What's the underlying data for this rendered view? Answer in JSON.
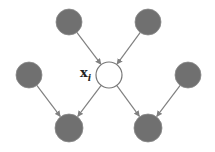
{
  "diagram": {
    "colors": {
      "observed_fill": "#707070",
      "observed_stroke": "#8a8a8a",
      "target_fill": "#ffffff",
      "target_stroke": "#777777",
      "edge": "#808080"
    },
    "target": {
      "label_main": "x",
      "label_sub": "i"
    },
    "nodes": [
      {
        "id": "parent-1",
        "role": "parent",
        "cx": 69,
        "cy": 22,
        "r": 13
      },
      {
        "id": "parent-2",
        "role": "parent",
        "cx": 148,
        "cy": 22,
        "r": 13
      },
      {
        "id": "coparent-1",
        "role": "co-parent",
        "cx": 29,
        "cy": 75,
        "r": 13
      },
      {
        "id": "target",
        "role": "target",
        "cx": 109,
        "cy": 75,
        "r": 13
      },
      {
        "id": "coparent-2",
        "role": "co-parent",
        "cx": 188,
        "cy": 75,
        "r": 13
      },
      {
        "id": "child-1",
        "role": "child",
        "cx": 69,
        "cy": 128,
        "r": 14
      },
      {
        "id": "child-2",
        "role": "child",
        "cx": 148,
        "cy": 128,
        "r": 14
      }
    ],
    "edges": [
      {
        "from": "parent-1",
        "to": "target"
      },
      {
        "from": "parent-2",
        "to": "target"
      },
      {
        "from": "target",
        "to": "child-1"
      },
      {
        "from": "target",
        "to": "child-2"
      },
      {
        "from": "coparent-1",
        "to": "child-1"
      },
      {
        "from": "coparent-2",
        "to": "child-2"
      }
    ]
  }
}
